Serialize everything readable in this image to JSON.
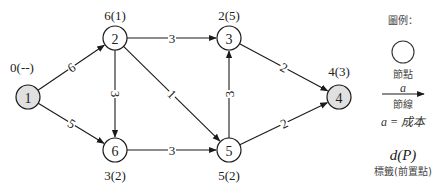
{
  "diagram": {
    "type": "shortest-path-network",
    "nodes": [
      {
        "id": "1",
        "x": 28,
        "y": 97,
        "fill": "#e0e0e0",
        "label": "0(--)",
        "label_x": 22,
        "label_y": 72
      },
      {
        "id": "2",
        "x": 115,
        "y": 38,
        "fill": "#ffffff",
        "label": "6(1)",
        "label_x": 115,
        "label_y": 20
      },
      {
        "id": "3",
        "x": 229,
        "y": 38,
        "fill": "#ffffff",
        "label": "2(5)",
        "label_x": 229,
        "label_y": 20
      },
      {
        "id": "4",
        "x": 339,
        "y": 97,
        "fill": "#e0e0e0",
        "label": "4(3)",
        "label_x": 339,
        "label_y": 76
      },
      {
        "id": "5",
        "x": 229,
        "y": 150,
        "fill": "#ffffff",
        "label": "5(2)",
        "label_x": 229,
        "label_y": 180
      },
      {
        "id": "6",
        "x": 115,
        "y": 150,
        "fill": "#ffffff",
        "label": "3(2)",
        "label_x": 115,
        "label_y": 180
      }
    ],
    "edges": [
      {
        "from": "1",
        "to": "2",
        "cost": "6"
      },
      {
        "from": "1",
        "to": "6",
        "cost": "5"
      },
      {
        "from": "2",
        "to": "3",
        "cost": "3"
      },
      {
        "from": "2",
        "to": "6",
        "cost": "3"
      },
      {
        "from": "2",
        "to": "5",
        "cost": "1"
      },
      {
        "from": "6",
        "to": "5",
        "cost": "3"
      },
      {
        "from": "5",
        "to": "3",
        "cost": "3"
      },
      {
        "from": "3",
        "to": "4",
        "cost": "2"
      },
      {
        "from": "5",
        "to": "4",
        "cost": "2"
      }
    ],
    "node_radius": 12
  },
  "legend": {
    "title": "圖例：",
    "node_caption": "節點",
    "edge_symbol": "a",
    "edge_caption": "節線",
    "cost_caption": "a = 成本",
    "label_symbol": "d(P)",
    "label_caption": "標籤(前置點)"
  }
}
